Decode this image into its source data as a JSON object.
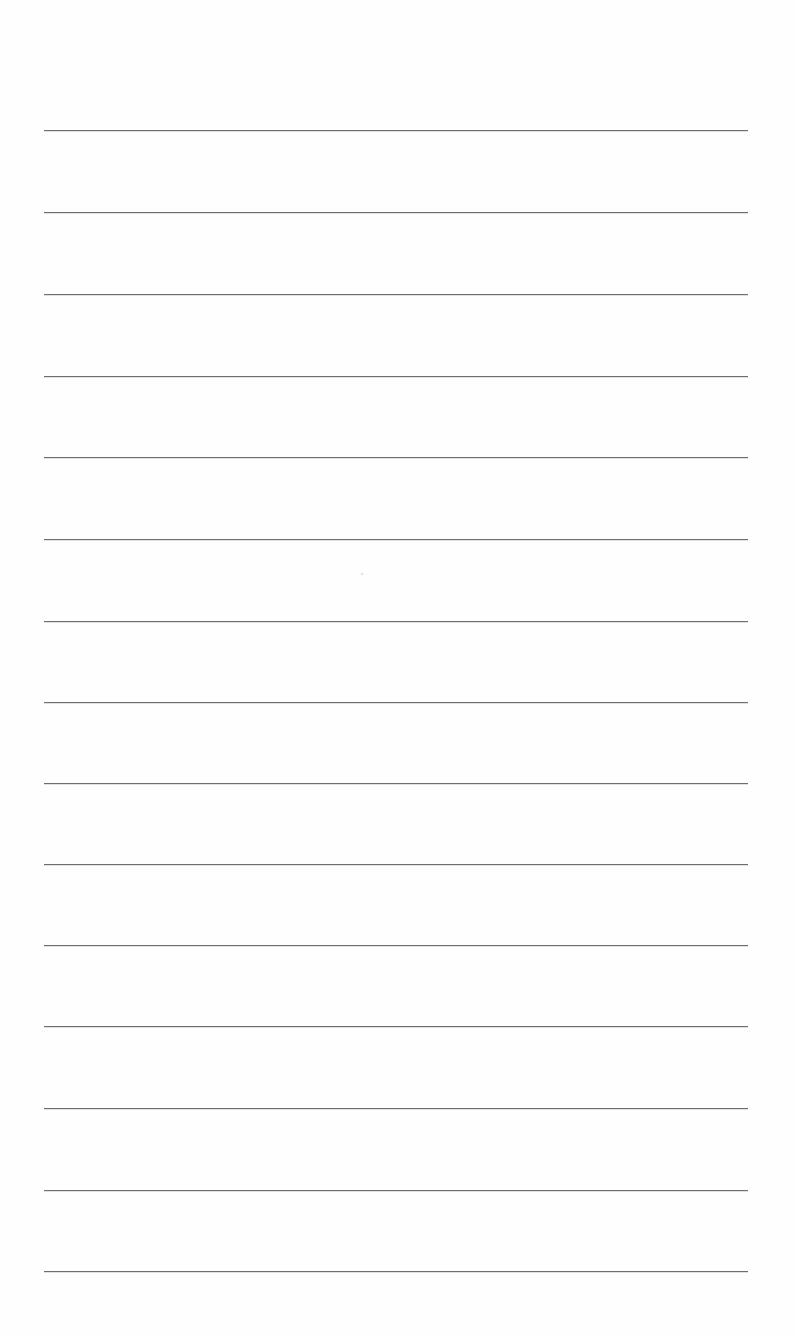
{
  "page": {
    "type": "lined-paper",
    "background_color": "#fefefe",
    "line_color": "#6e6e6e",
    "line_count": 15,
    "line_left_px": 44,
    "line_right_px": 748,
    "line_positions_px": [
      130,
      212,
      294,
      376,
      457,
      539,
      621,
      702,
      783,
      864,
      945,
      1026,
      1108,
      1190,
      1271
    ],
    "text": ""
  }
}
